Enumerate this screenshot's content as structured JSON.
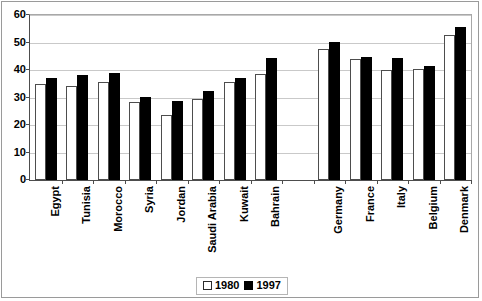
{
  "chart_data": {
    "type": "bar",
    "title": "",
    "subtitle": "",
    "xlabel": "",
    "ylabel": "",
    "ylim": [
      0,
      60
    ],
    "ytick_values": [
      60,
      50,
      40,
      30,
      20,
      10,
      0
    ],
    "ytick_labels": [
      "60",
      "50",
      "40",
      "30",
      "20",
      "10",
      "0"
    ],
    "grid": true,
    "legend_position": "bottom-center",
    "categories": [
      "Egypt",
      "Tunisia",
      "Morocco",
      "Syria",
      "Jordan",
      "Saudi Arabia",
      "Kuwait",
      "Bahrain",
      "",
      "Germany",
      "France",
      "Italy",
      "Belgium",
      "Denmark"
    ],
    "series": [
      {
        "name": "1980",
        "color": "#ffffff",
        "edge_color": "#4d4d4d",
        "values": [
          35.0,
          34.3,
          35.8,
          28.3,
          23.6,
          29.3,
          35.8,
          38.6,
          null,
          47.6,
          44.1,
          40.1,
          40.4,
          52.9
        ]
      },
      {
        "name": "1997",
        "color": "#000000",
        "edge_color": "#000000",
        "values": [
          37.1,
          38.3,
          39.0,
          30.3,
          28.8,
          32.4,
          37.1,
          44.5,
          null,
          50.1,
          44.8,
          44.5,
          41.3,
          55.6
        ]
      }
    ]
  },
  "legend": {
    "entries": [
      {
        "label": "1980",
        "swatch": "hollow"
      },
      {
        "label": "1997",
        "swatch": "solid"
      }
    ]
  }
}
